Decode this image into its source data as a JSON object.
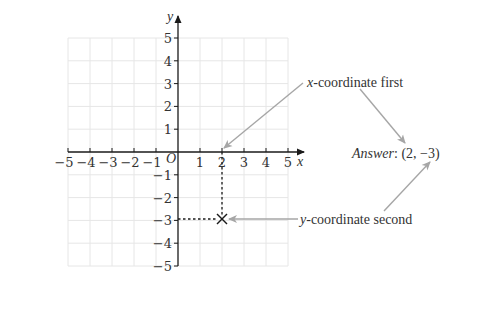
{
  "diagram": {
    "axes": {
      "x_label": "x",
      "y_label": "y",
      "origin_label": "O",
      "x_ticks": [
        "−5",
        "−4",
        "−3",
        "−2",
        "−1",
        "1",
        "2",
        "3",
        "4",
        "5"
      ],
      "y_ticks_pos": [
        "5",
        "4",
        "3",
        "2",
        "1"
      ],
      "y_ticks_neg": [
        "−1",
        "−2",
        "−3",
        "−4",
        "−5"
      ],
      "range": {
        "xmin": -5,
        "xmax": 5,
        "ymin": -5,
        "ymax": 5
      }
    },
    "point": {
      "x": 2,
      "y": -3,
      "marker": "cross"
    },
    "annotations": {
      "x_first_var": "x",
      "x_first_text": "-coordinate first",
      "y_second_var": "y",
      "y_second_text": "-coordinate second",
      "answer_label": "Answer",
      "answer_value": ": (2, −3)"
    },
    "colors": {
      "grid": "#e6e6e6",
      "axis": "#1a1a1a",
      "arrow": "#a6a6a6",
      "text": "#333333"
    }
  }
}
